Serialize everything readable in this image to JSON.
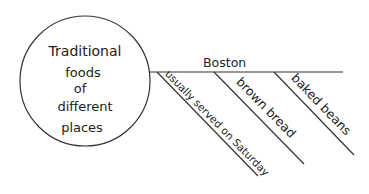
{
  "diagram": {
    "type": "web-organizer",
    "central_topic": {
      "lines": [
        "Traditional",
        "foods",
        "of",
        "different",
        "places"
      ]
    },
    "branches": [
      {
        "label": "Boston",
        "details": [
          "usually served on Saturday",
          "brown bread",
          "baked beans"
        ]
      }
    ],
    "colors": {
      "line": "#333333",
      "text": "#222222",
      "background": "#ffffff"
    }
  }
}
